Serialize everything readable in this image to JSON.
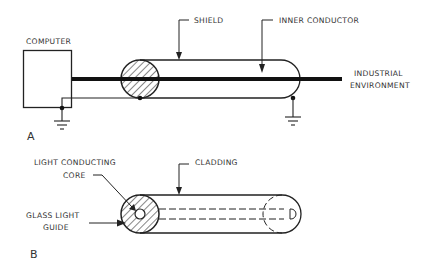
{
  "figure": {
    "panel_a": {
      "letter": "A",
      "labels": {
        "computer": "COMPUTER",
        "shield": "SHIELD",
        "inner_conductor": "INNER CONDUCTOR",
        "industrial_line1": "INDUSTRIAL",
        "industrial_line2": "ENVIRONMENT"
      }
    },
    "panel_b": {
      "letter": "B",
      "labels": {
        "core_line1": "LIGHT CONDUCTING",
        "core_line2": "CORE",
        "cladding": "CLADDING",
        "guide_line1": "GLASS LIGHT",
        "guide_line2": "GUIDE"
      }
    },
    "colors": {
      "ink": "#222222",
      "background": "#ffffff"
    }
  }
}
